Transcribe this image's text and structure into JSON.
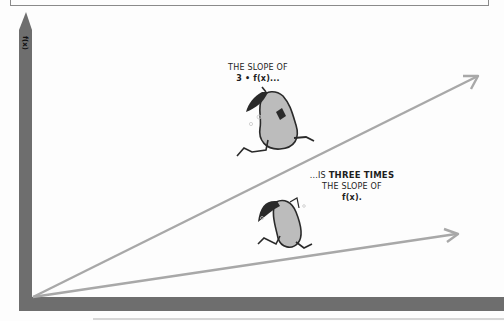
{
  "figure": {
    "y_axis_label": "f(x)",
    "caption_top_line1": "THE SLOPE OF",
    "caption_top_line2": "3 • f(x)...",
    "caption_bottom_prefix": "...IS",
    "caption_bottom_emphasis": "THREE TIMES",
    "caption_bottom_line2": "THE SLOPE OF",
    "caption_bottom_line3": "f(x).",
    "characters": [
      {
        "name": "pear-running-fast",
        "on_line": "3f(x)"
      },
      {
        "name": "pear-running-slow",
        "on_line": "f(x)"
      }
    ],
    "colors": {
      "axis": "#6e6e6e",
      "line": "#a8a8a8",
      "pear_body": "#b8b8b8",
      "pear_outline": "#2a2a2a",
      "text": "#1e1e1e",
      "background": "#fdfdfd"
    },
    "lines": [
      {
        "label": "3f(x)",
        "slope_ratio": 3,
        "x1": 33,
        "y1": 297,
        "x2": 478,
        "y2": 76
      },
      {
        "label": "f(x)",
        "slope_ratio": 1,
        "x1": 33,
        "y1": 297,
        "x2": 458,
        "y2": 234
      }
    ]
  }
}
